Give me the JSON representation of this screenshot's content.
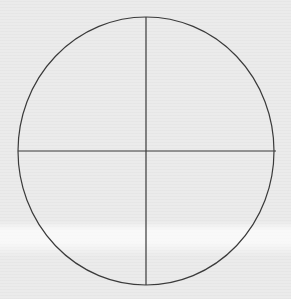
{
  "diagram": {
    "type": "circle-divided-into-quarters",
    "background_color": "#ebebeb",
    "stroke_color": "#3a3a3a",
    "circle": {
      "cx": 146,
      "cy": 151,
      "rx": 128,
      "ry": 134
    },
    "vertical_divider": {
      "x": 146,
      "y1": 17,
      "y2": 285
    },
    "horizontal_divider": {
      "y": 151,
      "x1": 18,
      "x2": 276
    },
    "quadrants": 4
  }
}
